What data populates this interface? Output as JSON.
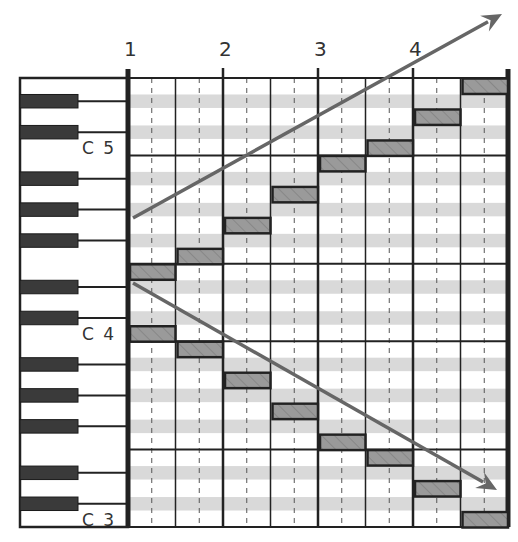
{
  "diagram": {
    "type": "piano-roll",
    "measure_labels": [
      "1",
      "2",
      "3",
      "4"
    ],
    "octave_labels": [
      {
        "label": "C 5",
        "row": 4
      },
      {
        "label": "C 4",
        "row": 16
      },
      {
        "label": "C 3",
        "row": 28
      }
    ],
    "rows_top_to_bottom": [
      "E5",
      "D#5",
      "D5",
      "C#5",
      "C5",
      "B4",
      "A#4",
      "A4",
      "G#4",
      "G4",
      "F#4",
      "F4",
      "E4",
      "D#4",
      "D4",
      "C#4",
      "C4",
      "B3",
      "A#3",
      "A3",
      "G#3",
      "G3",
      "F#3",
      "F3",
      "E3",
      "D#3",
      "D3",
      "C#3",
      "C3"
    ],
    "columns": 8,
    "beats_per_measure": 2,
    "ascending_notes": [
      {
        "pitch": "E4",
        "column": 1
      },
      {
        "pitch": "F4",
        "column": 2
      },
      {
        "pitch": "G4",
        "column": 3
      },
      {
        "pitch": "A4",
        "column": 4
      },
      {
        "pitch": "B4",
        "column": 5
      },
      {
        "pitch": "C5",
        "column": 6
      },
      {
        "pitch": "D5",
        "column": 7
      },
      {
        "pitch": "E5",
        "column": 8
      }
    ],
    "descending_notes": [
      {
        "pitch": "C4",
        "column": 1
      },
      {
        "pitch": "B3",
        "column": 2
      },
      {
        "pitch": "A3",
        "column": 3
      },
      {
        "pitch": "G3",
        "column": 4
      },
      {
        "pitch": "F3",
        "column": 5
      },
      {
        "pitch": "E3",
        "column": 6
      },
      {
        "pitch": "D3",
        "column": 7
      },
      {
        "pitch": "C3",
        "column": 8
      }
    ],
    "arrows": [
      {
        "name": "ascending-arrow",
        "x1": 133,
        "y1": 218,
        "x2": 502,
        "y2": 14
      },
      {
        "name": "descending-arrow",
        "x1": 133,
        "y1": 283,
        "x2": 497,
        "y2": 490
      }
    ],
    "colors": {
      "line": "#222222",
      "black_key": "#3a3a3a",
      "stripe": "#d9d9d9",
      "note_fill": "#9a9a9a",
      "note_border": "#222222",
      "arrow": "#666666",
      "label": "#333333"
    }
  }
}
